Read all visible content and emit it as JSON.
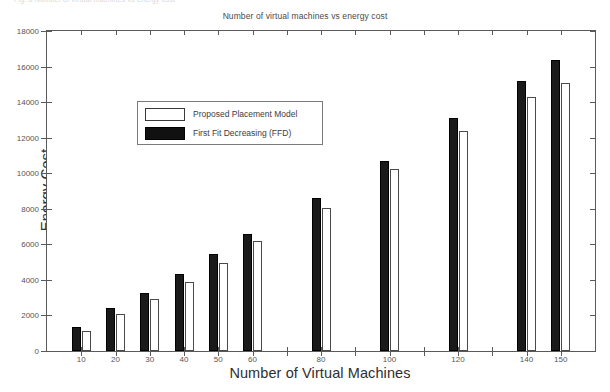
{
  "figure": {
    "ghost_caption": "Fig. 8  Number of virtual machines vs energy cost",
    "background_color": "#ffffff"
  },
  "chart_data": {
    "type": "bar",
    "title": "Number of virtual machines vs energy cost",
    "xlabel": "Number of Virtual Machines",
    "ylabel": "Energy Cost",
    "categories": [
      "10",
      "20",
      "30",
      "40",
      "50",
      "60",
      "80",
      "100",
      "120",
      "140",
      "150"
    ],
    "series": [
      {
        "name": "First Fit Decreasing (FFD)",
        "color": "#111111",
        "style": "filled",
        "values": [
          1350,
          2400,
          3250,
          4350,
          5450,
          6600,
          8600,
          10700,
          13100,
          15200,
          16350
        ]
      },
      {
        "name": "Proposed Placement Model",
        "color": "#ffffff",
        "style": "hollow",
        "values": [
          1150,
          2100,
          2950,
          3900,
          4950,
          6200,
          8050,
          10250,
          12400,
          14300,
          15100
        ]
      }
    ],
    "ylim": [
      0,
      18000
    ],
    "ytick_values": [
      0,
      2000,
      4000,
      6000,
      8000,
      10000,
      12000,
      14000,
      16000,
      18000
    ],
    "ytick_labels": [
      "0",
      "2000",
      "4000",
      "6000",
      "8000",
      "10000",
      "12000",
      "14000",
      "16000",
      "18000"
    ],
    "xtick_labels": [
      "10",
      "20",
      "30",
      "40",
      "50",
      "60",
      "80",
      "100",
      "120",
      "140",
      "150"
    ],
    "grid": false,
    "legend_position": "upper-left-inside",
    "legend_entries": [
      "Proposed Placement Model",
      "First Fit Decreasing (FFD)"
    ]
  },
  "legend": {
    "entries": [
      {
        "label": "Proposed Placement Model",
        "swatch": "white-bar-swatch"
      },
      {
        "label": "First Fit Decreasing (FFD)",
        "swatch": "black-bar-swatch"
      }
    ]
  }
}
